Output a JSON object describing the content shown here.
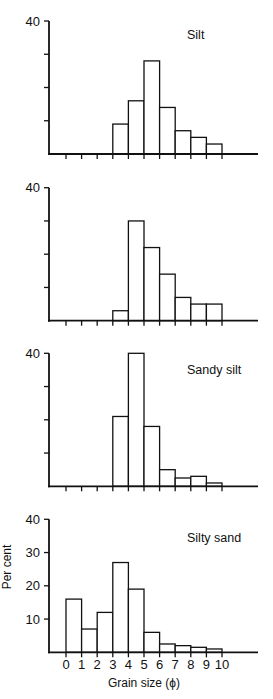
{
  "figure": {
    "ylabel": "Per cent",
    "xlabel": "Grain size (ϕ)",
    "x_tick_labels": [
      "0",
      "1",
      "2",
      "3",
      "4",
      "5",
      "6",
      "7",
      "8",
      "9",
      "10"
    ]
  },
  "chart_data": [
    {
      "type": "bar",
      "title": "Silt",
      "xlabel": "",
      "ylabel": "",
      "categories": [
        "0-1",
        "1-2",
        "2-3",
        "3-4",
        "4-5",
        "5-6",
        "6-7",
        "7-8",
        "8-9",
        "9-10"
      ],
      "values": [
        0,
        0,
        0,
        9,
        16,
        28,
        14,
        7,
        5,
        3
      ],
      "y_tick_labels": [
        "40"
      ],
      "y_ticks": [
        10,
        20,
        30,
        40
      ],
      "ylim": [
        0,
        40
      ],
      "x_tick_labels": [],
      "grid": false
    },
    {
      "type": "bar",
      "title": "",
      "xlabel": "",
      "ylabel": "",
      "categories": [
        "0-1",
        "1-2",
        "2-3",
        "3-4",
        "4-5",
        "5-6",
        "6-7",
        "7-8",
        "8-9",
        "9-10"
      ],
      "values": [
        0,
        0,
        0,
        3,
        30,
        22,
        14,
        7,
        5,
        5
      ],
      "y_tick_labels": [
        "40"
      ],
      "y_ticks": [
        10,
        20,
        30,
        40
      ],
      "ylim": [
        0,
        40
      ],
      "x_tick_labels": [],
      "grid": false
    },
    {
      "type": "bar",
      "title": "Sandy silt",
      "xlabel": "",
      "ylabel": "",
      "categories": [
        "0-1",
        "1-2",
        "2-3",
        "3-4",
        "4-5",
        "5-6",
        "6-7",
        "7-8",
        "8-9",
        "9-10"
      ],
      "values": [
        0,
        0,
        0,
        21,
        40,
        18,
        5,
        2.5,
        3,
        1
      ],
      "y_tick_labels": [
        "40"
      ],
      "y_ticks": [
        10,
        20,
        30,
        40
      ],
      "ylim": [
        0,
        40
      ],
      "x_tick_labels": [],
      "grid": false
    },
    {
      "type": "bar",
      "title": "Silty sand",
      "xlabel": "Grain size (ϕ)",
      "ylabel": "Per cent",
      "categories": [
        "0-1",
        "1-2",
        "2-3",
        "3-4",
        "4-5",
        "5-6",
        "6-7",
        "7-8",
        "8-9",
        "9-10"
      ],
      "values": [
        16,
        7,
        12,
        27,
        19,
        6,
        2.5,
        2,
        1.5,
        1
      ],
      "y_tick_labels": [
        "10",
        "20",
        "30",
        "40"
      ],
      "y_ticks": [
        10,
        20,
        30,
        40
      ],
      "ylim": [
        0,
        40
      ],
      "x_tick_labels": [
        "0",
        "1",
        "2",
        "3",
        "4",
        "5",
        "6",
        "7",
        "8",
        "9",
        "10"
      ],
      "grid": false
    }
  ]
}
